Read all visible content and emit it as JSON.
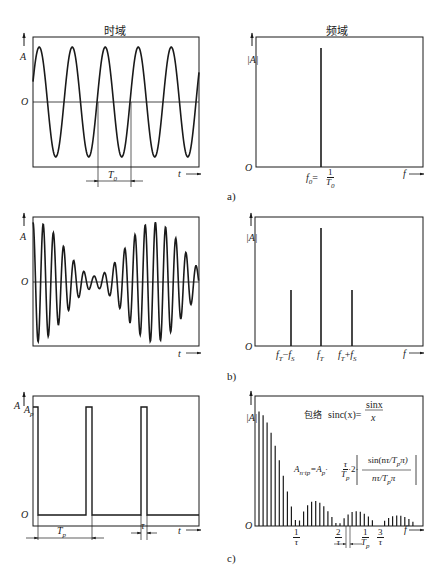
{
  "titles": {
    "time_domain": "时域",
    "freq_domain": "频域"
  },
  "captions": {
    "a": "a)",
    "b": "b)",
    "c": "c)"
  },
  "axes": {
    "amp": "A",
    "amp_abs": "|A|",
    "origin": "O",
    "time": "t",
    "freq": "f",
    "pulse_amp": "A",
    "pulse_amp_sub": "p"
  },
  "panel_a": {
    "period_label": "T",
    "period_sub": "0",
    "freq_label": "f",
    "freq_sub": "0",
    "freq_eq": "=",
    "freq_num": "1",
    "freq_den": "T",
    "freq_den_sub": "0"
  },
  "panel_b": {
    "lines": [
      {
        "label": "f",
        "sub": "T",
        "op": "−",
        "label2": "f",
        "sub2": "S"
      },
      {
        "label": "f",
        "sub": "T"
      },
      {
        "label": "f",
        "sub": "T",
        "op": "+",
        "label2": "f",
        "sub2": "S"
      }
    ]
  },
  "panel_c": {
    "period_label": "T",
    "period_sub": "p",
    "width_label": "τ",
    "envelope_label": "包络",
    "envelope_formula": "sinc(x)=",
    "envelope_num": "sinx",
    "envelope_den": "x",
    "amplitude_formula_lhs": "A",
    "amplitude_formula_lhs_sub": "n·tp",
    "amplitude_formula_mid": "=A",
    "amplitude_formula_mid_sub": "p",
    "amplitude_formula_tail": "·2·",
    "amplitude_ratio_num": "τ",
    "amplitude_ratio_den": "T",
    "amplitude_ratio_den_sub": "p",
    "amplitude_inner_num": "sin(n",
    "amplitude_inner_num_tail": "π)",
    "amplitude_inner_den": "n",
    "amplitude_inner_den_tail": "π",
    "x_ticks": [
      {
        "num": "1",
        "den": "τ"
      },
      {
        "num": "2",
        "den": "τ"
      },
      {
        "num": "1",
        "den": "T",
        "den_sub": "p"
      },
      {
        "num": "3",
        "den": "τ"
      }
    ]
  },
  "chart_data": [
    {
      "type": "line",
      "title": "时域 (a)",
      "xlabel": "t",
      "ylabel": "A",
      "description": "pure sine wave, 5 periods, period T0",
      "periods": 5
    },
    {
      "type": "bar",
      "title": "频域 (a)",
      "xlabel": "f",
      "ylabel": "|A|",
      "categories": [
        "f0=1/T0"
      ],
      "values": [
        1.0
      ]
    },
    {
      "type": "line",
      "title": "时域 (b)",
      "xlabel": "t",
      "ylabel": "A",
      "description": "amplitude-modulated carrier (beat signal)"
    },
    {
      "type": "bar",
      "title": "频域 (b)",
      "xlabel": "f",
      "ylabel": "|A|",
      "categories": [
        "fT−fS",
        "fT",
        "fT+fS"
      ],
      "values": [
        0.5,
        1.0,
        0.5
      ]
    },
    {
      "type": "line",
      "title": "时域 (c)",
      "xlabel": "t",
      "ylabel": "A",
      "description": "rectangular pulse train, amplitude Ap, period Tp, width τ"
    },
    {
      "type": "bar",
      "title": "频域 (c)",
      "xlabel": "f",
      "ylabel": "|A|",
      "description": "line spectrum with |sinc| envelope, zeros at 1/τ, 2/τ, 3/τ, line spacing 1/Tp",
      "x_ticks": [
        "1/τ",
        "2/τ",
        "1/Tp",
        "3/τ"
      ]
    }
  ]
}
